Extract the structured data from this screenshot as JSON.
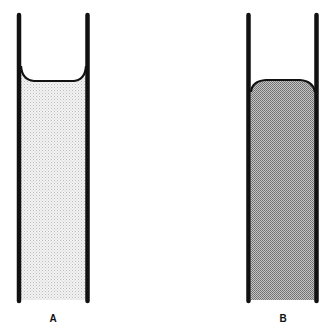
{
  "figure": {
    "tubes": [
      {
        "id": "A",
        "label": "A",
        "meniscus": "concave",
        "fill": "#e6e6e6",
        "left_wall_x": 19,
        "right_wall_x": 87.5,
        "top_y": 14,
        "bottom_y": 302,
        "meniscus_edge_y": 69,
        "meniscus_center_y": 81
      },
      {
        "id": "B",
        "label": "B",
        "meniscus": "convex",
        "fill": "#9a9a9a",
        "left_wall_x": 248.5,
        "right_wall_x": 316.5,
        "top_y": 14,
        "bottom_y": 302,
        "meniscus_edge_y": 90,
        "meniscus_center_y": 81
      }
    ],
    "colors": {
      "wall": "#111111",
      "background": "#ffffff"
    }
  }
}
